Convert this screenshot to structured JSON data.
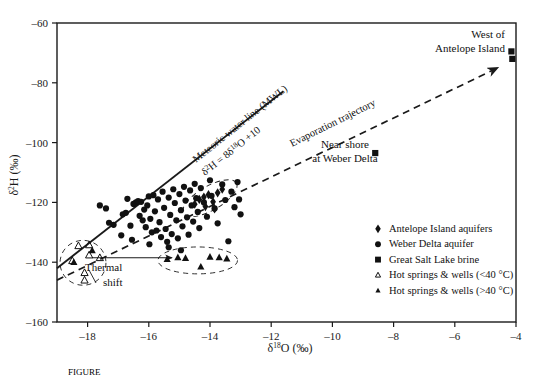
{
  "figure": {
    "caption": "FIGURE",
    "axes": {
      "x": {
        "label_delta": "δ",
        "label_sup": "18",
        "label_main": "O (‰)",
        "ticks": [
          "–18",
          "–16",
          "–14",
          "–12",
          "–10",
          "–8",
          "–6",
          "–4"
        ],
        "min": -19,
        "max": -4
      },
      "y": {
        "label_delta": "δ",
        "label_sup": "2",
        "label_main": "H (‰)",
        "ticks": [
          "–60",
          "–80",
          "–100",
          "–120",
          "–140",
          "–160"
        ],
        "min": -160,
        "max": -60
      }
    },
    "annotations": {
      "mwl_line1": "Meteoric water line (MWL)",
      "mwl_eq_delta": "δ",
      "mwl_eq_sup1": "2",
      "mwl_eq_mid": "H = 8δ",
      "mwl_eq_sup2": "18",
      "mwl_eq_end": "O +10",
      "evaporation": "Evaporation trajectory",
      "thermal_line1": "Thermal",
      "thermal_line2": "shift",
      "west_antelope_line1": "West of",
      "west_antelope_line2": "Antelope Island",
      "near_shore_line1": "Near shore",
      "near_shore_line2": "at Weber Delta"
    },
    "legend": {
      "items": [
        {
          "marker": "diamond-filled",
          "label": "Antelope Island aquifers"
        },
        {
          "marker": "circle-filled",
          "label": "Weber Delta aquifer"
        },
        {
          "marker": "square-filled",
          "label": "Great Salt Lake brine"
        },
        {
          "marker": "triangle-open",
          "label": "Hot springs & wells (<40 °C)"
        },
        {
          "marker": "triangle-filled",
          "label": "Hot springs & wells (>40 °C)"
        }
      ]
    },
    "colors": {
      "axis": "#1a1a1a",
      "marker": "#111111",
      "line": "#1a1a1a"
    }
  },
  "chart_data": {
    "type": "scatter",
    "title": "",
    "xlabel": "δ18O (‰)",
    "ylabel": "δ2H (‰)",
    "xlim": [
      -19,
      -4
    ],
    "ylim": [
      -160,
      -60
    ],
    "grid": false,
    "legend_position": "lower-right-inside",
    "lines": [
      {
        "name": "Meteoric water line (MWL)",
        "equation": "δ2H = 8δ18O + 10",
        "style": "solid",
        "x": [
          -19,
          -11.6
        ],
        "y": [
          -142,
          -82.8
        ]
      },
      {
        "name": "Evaporation trajectory",
        "style": "dashed-arrow",
        "x": [
          -19,
          -4.6
        ],
        "y": [
          -146,
          -75
        ]
      },
      {
        "name": "Thermal shift arrow",
        "style": "solid-arrow",
        "x": [
          -17.85,
          -15.25
        ],
        "y": [
          -138.5,
          -138.5
        ]
      }
    ],
    "series": [
      {
        "name": "Weber Delta aquifer",
        "marker": "circle-filled",
        "points": [
          [
            -17.15,
            -127.5
          ],
          [
            -16.85,
            -124.0
          ],
          [
            -16.75,
            -123.5
          ],
          [
            -16.6,
            -127.8
          ],
          [
            -16.5,
            -120.5
          ],
          [
            -16.42,
            -120.0
          ],
          [
            -16.35,
            -119.6
          ],
          [
            -16.3,
            -124.5
          ],
          [
            -16.25,
            -119.8
          ],
          [
            -16.2,
            -126.0
          ],
          [
            -16.15,
            -122.4
          ],
          [
            -16.1,
            -128.3
          ],
          [
            -16.05,
            -121.0
          ],
          [
            -16.0,
            -118.0
          ],
          [
            -15.95,
            -125.5
          ],
          [
            -15.9,
            -130.0
          ],
          [
            -15.85,
            -117.6
          ],
          [
            -15.8,
            -123.0
          ],
          [
            -15.75,
            -129.4
          ],
          [
            -15.7,
            -119.0
          ],
          [
            -15.65,
            -126.6
          ],
          [
            -15.6,
            -131.6
          ],
          [
            -15.55,
            -116.4
          ],
          [
            -15.5,
            -121.8
          ],
          [
            -15.45,
            -128.9
          ],
          [
            -15.4,
            -133.2
          ],
          [
            -15.35,
            -118.4
          ],
          [
            -15.3,
            -124.2
          ],
          [
            -15.25,
            -130.6
          ],
          [
            -15.2,
            -115.6
          ],
          [
            -15.15,
            -120.2
          ],
          [
            -15.1,
            -126.0
          ],
          [
            -15.05,
            -132.0
          ],
          [
            -15.0,
            -117.2
          ],
          [
            -14.95,
            -122.6
          ],
          [
            -14.9,
            -128.0
          ],
          [
            -14.85,
            -114.8
          ],
          [
            -14.8,
            -119.4
          ],
          [
            -14.75,
            -125.0
          ],
          [
            -14.7,
            -130.8
          ],
          [
            -14.65,
            -116.0
          ],
          [
            -14.6,
            -121.0
          ],
          [
            -14.55,
            -126.4
          ],
          [
            -14.5,
            -113.8
          ],
          [
            -14.45,
            -118.6
          ],
          [
            -14.4,
            -123.2
          ],
          [
            -14.35,
            -128.6
          ],
          [
            -14.3,
            -115.2
          ],
          [
            -14.2,
            -120.0
          ],
          [
            -14.1,
            -124.8
          ],
          [
            -14.0,
            -112.6
          ],
          [
            -13.95,
            -117.8
          ],
          [
            -13.85,
            -122.0
          ],
          [
            -13.75,
            -127.0
          ],
          [
            -13.6,
            -114.0
          ],
          [
            -13.5,
            -119.2
          ],
          [
            -13.4,
            -133.0
          ],
          [
            -13.3,
            -116.4
          ],
          [
            -13.2,
            -121.6
          ],
          [
            -13.1,
            -113.2
          ],
          [
            -17.6,
            -121.0
          ],
          [
            -17.4,
            -122.0
          ],
          [
            -17.3,
            -126.8
          ],
          [
            -16.9,
            -131.0
          ],
          [
            -16.7,
            -118.8
          ],
          [
            -16.55,
            -132.5
          ],
          [
            -15.98,
            -134.0
          ],
          [
            -15.35,
            -135.0
          ],
          [
            -14.95,
            -136.0
          ],
          [
            -13.05,
            -119.0
          ],
          [
            -13.0,
            -124.0
          ]
        ]
      },
      {
        "name": "Antelope Island aquifers",
        "marker": "diamond-filled",
        "points": [
          [
            -14.35,
            -119.0
          ],
          [
            -14.2,
            -118.2
          ],
          [
            -14.05,
            -117.4
          ],
          [
            -13.9,
            -119.8
          ],
          [
            -13.75,
            -116.8
          ],
          [
            -13.6,
            -115.6
          ],
          [
            -14.5,
            -120.6
          ],
          [
            -14.15,
            -121.4
          ],
          [
            -13.85,
            -122.2
          ]
        ]
      },
      {
        "name": "Great Salt Lake brine",
        "marker": "square-filled",
        "points": [
          [
            -4.15,
            -69.5
          ],
          [
            -4.12,
            -72.0
          ],
          [
            -8.6,
            -103.5
          ]
        ]
      },
      {
        "name": "Hot springs & wells (<40 °C)",
        "marker": "triangle-open",
        "points": [
          [
            -18.3,
            -134.5
          ],
          [
            -17.95,
            -134.2
          ],
          [
            -18.5,
            -139.5
          ],
          [
            -17.95,
            -137.6
          ],
          [
            -17.6,
            -138.5
          ],
          [
            -18.1,
            -143.5
          ],
          [
            -18.1,
            -146.0
          ]
        ]
      },
      {
        "name": "Hot springs & wells (>40 °C)",
        "marker": "triangle-filled",
        "points": [
          [
            -18.45,
            -140.0
          ],
          [
            -17.85,
            -136.0
          ],
          [
            -15.05,
            -138.4
          ],
          [
            -14.8,
            -138.6
          ],
          [
            -14.3,
            -141.5
          ],
          [
            -14.0,
            -138.2
          ],
          [
            -13.7,
            -138.4
          ],
          [
            -13.45,
            -138.8
          ],
          [
            -15.4,
            -139.0
          ]
        ]
      }
    ],
    "enclosure_outlines": [
      {
        "name": "cold-springs-ellipse",
        "cx": -18.15,
        "cy": -140.2,
        "rx": 0.75,
        "ry": 7.5
      },
      {
        "name": "hot-springs-ellipse",
        "cx": -14.4,
        "cy": -139.4,
        "rx": 1.3,
        "ry": 4.5
      },
      {
        "name": "antelope-island-ellipse",
        "cx": -14.0,
        "cy": -118.6,
        "rx": 1.0,
        "ry": 4.0
      }
    ]
  }
}
